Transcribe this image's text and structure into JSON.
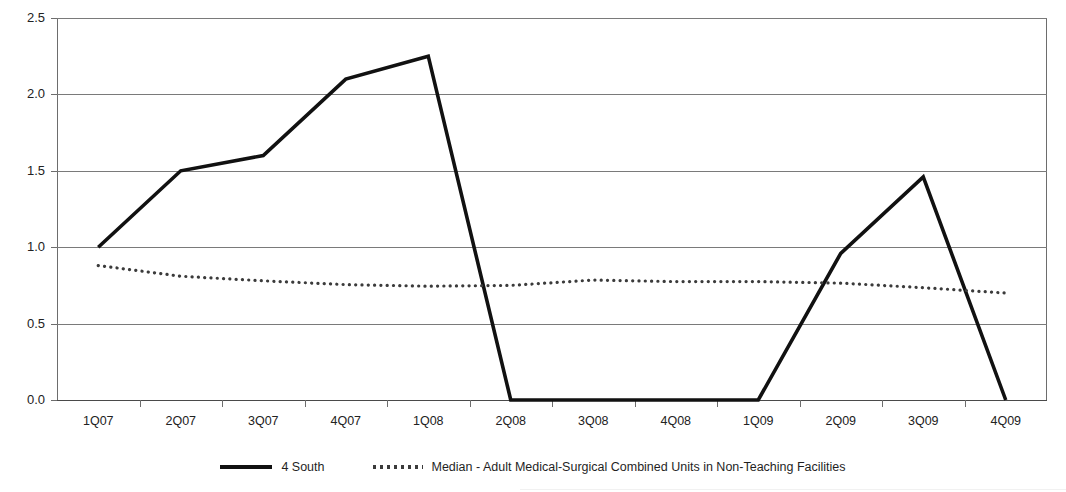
{
  "chart_data": {
    "type": "line",
    "title": "",
    "xlabel": "",
    "ylabel": "",
    "ylim": [
      0.0,
      2.5
    ],
    "ytick_step": 0.5,
    "grid": true,
    "legend_position": "bottom",
    "categories": [
      "1Q07",
      "2Q07",
      "3Q07",
      "4Q07",
      "1Q08",
      "2Q08",
      "3Q08",
      "4Q08",
      "1Q09",
      "2Q09",
      "3Q09",
      "4Q09"
    ],
    "ytick_labels": [
      "0.0",
      "0.5",
      "1.0",
      "1.5",
      "2.0",
      "2.5"
    ],
    "ytick_values": [
      0.0,
      0.5,
      1.0,
      1.5,
      2.0,
      2.5
    ],
    "series": [
      {
        "name": "4 South",
        "style": "solid",
        "color": "#111111",
        "values": [
          1.0,
          1.5,
          1.6,
          2.1,
          2.25,
          0.0,
          0.0,
          0.0,
          0.0,
          0.96,
          1.46,
          0.0
        ]
      },
      {
        "name": "Median - Adult Medical-Surgical Combined Units in Non-Teaching Facilities",
        "style": "dotted",
        "color": "#3b3b3b",
        "values": [
          0.88,
          0.81,
          0.78,
          0.755,
          0.745,
          0.75,
          0.785,
          0.775,
          0.775,
          0.765,
          0.735,
          0.7
        ]
      }
    ]
  },
  "legend": {
    "items": [
      {
        "label": "4 South",
        "marker": "solid-line-swatch"
      },
      {
        "label": "Median - Adult Medical-Surgical Combined Units in Non-Teaching Facilities",
        "marker": "dotted-line-swatch"
      }
    ]
  },
  "axes": {
    "y_labels": [
      "2.5",
      "2.0",
      "1.5",
      "1.0",
      "0.5",
      "0.0"
    ],
    "x_labels": [
      "1Q07",
      "2Q07",
      "3Q07",
      "4Q07",
      "1Q08",
      "2Q08",
      "3Q08",
      "4Q08",
      "1Q09",
      "2Q09",
      "3Q09",
      "4Q09"
    ]
  }
}
